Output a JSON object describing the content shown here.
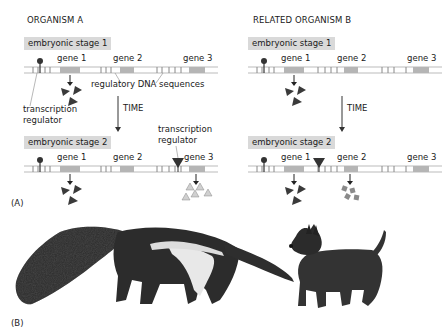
{
  "panelA": {
    "label": "(A)",
    "organismA": {
      "title": "ORGANISM A",
      "stage1": "embryonic stage 1",
      "stage2": "embryonic stage 2",
      "genes": [
        "gene 1",
        "gene 2",
        "gene 3"
      ],
      "annotation_regulatory": "regulatory DNA sequences",
      "annotation_regulator_line1": "transcription",
      "annotation_regulator_line2": "regulator",
      "annotation_regulator2_line1": "transcription",
      "annotation_regulator2_line2": "regulator",
      "time_label": "TIME"
    },
    "organismB": {
      "title": "RELATED ORGANISM B",
      "stage1": "embryonic stage 1",
      "stage2": "embryonic stage 2",
      "genes": [
        "gene 1",
        "gene 2",
        "gene 3"
      ],
      "time_label": "TIME"
    }
  },
  "panelB": {
    "label": "(B)",
    "animals": [
      "anteater-illustration",
      "terrier-dog-illustration"
    ]
  },
  "colors": {
    "stage_box": "#d9d9d9",
    "gene_block": "#b5b5b5",
    "protein_dark": "#3a3a3a",
    "protein_light": "#c8c8c8",
    "protein_square": "#8a8a8a",
    "dna_line": "#9a9a9a"
  }
}
